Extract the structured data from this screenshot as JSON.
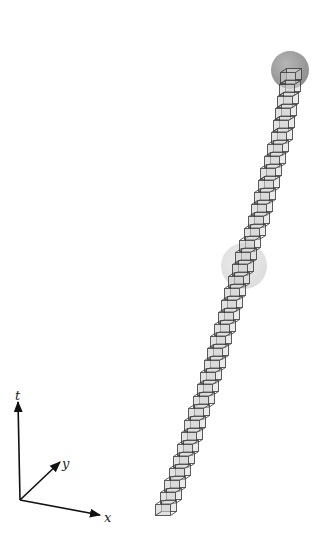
{
  "figure": {
    "type": "spacetime-worldline-diagram",
    "colors": {
      "background": "#ffffff",
      "box_fill": "#d0d0d0",
      "box_stroke": "#333333",
      "sphere_top": "#8a8a8a",
      "sphere_mid": "#c8c8c8",
      "axis": "#111111"
    },
    "spheres": [
      {
        "name": "top-sphere",
        "cx": 290,
        "cy": 70,
        "r": 19,
        "opacity": 0.85
      },
      {
        "name": "middle-sphere",
        "cx": 244,
        "cy": 266,
        "r": 23,
        "opacity": 0.55
      }
    ],
    "box_chain": {
      "size": 15,
      "depth": 6,
      "centers": [
        [
          288,
          78
        ],
        [
          287,
          90
        ],
        [
          285,
          102
        ],
        [
          283,
          114
        ],
        [
          281,
          126
        ],
        [
          279,
          138
        ],
        [
          275,
          150
        ],
        [
          272,
          162
        ],
        [
          268,
          174
        ],
        [
          266,
          186
        ],
        [
          262,
          198
        ],
        [
          259,
          210
        ],
        [
          256,
          222
        ],
        [
          252,
          234
        ],
        [
          247,
          246
        ],
        [
          243,
          258
        ],
        [
          240,
          270
        ],
        [
          236,
          282
        ],
        [
          232,
          294
        ],
        [
          229,
          306
        ],
        [
          226,
          318
        ],
        [
          222,
          330
        ],
        [
          218,
          342
        ],
        [
          215,
          354
        ],
        [
          212,
          366
        ],
        [
          208,
          378
        ],
        [
          205,
          390
        ],
        [
          201,
          402
        ],
        [
          196,
          414
        ],
        [
          192,
          426
        ],
        [
          189,
          438
        ],
        [
          185,
          450
        ],
        [
          181,
          462
        ],
        [
          177,
          474
        ],
        [
          172,
          486
        ],
        [
          168,
          498
        ],
        [
          163,
          510
        ]
      ]
    },
    "axes": {
      "origin": [
        20,
        500
      ],
      "t": {
        "label": "t",
        "end": [
          18,
          402
        ]
      },
      "y": {
        "label": "y",
        "end": [
          60,
          462
        ]
      },
      "x": {
        "label": "x",
        "end": [
          100,
          515
        ]
      }
    }
  }
}
